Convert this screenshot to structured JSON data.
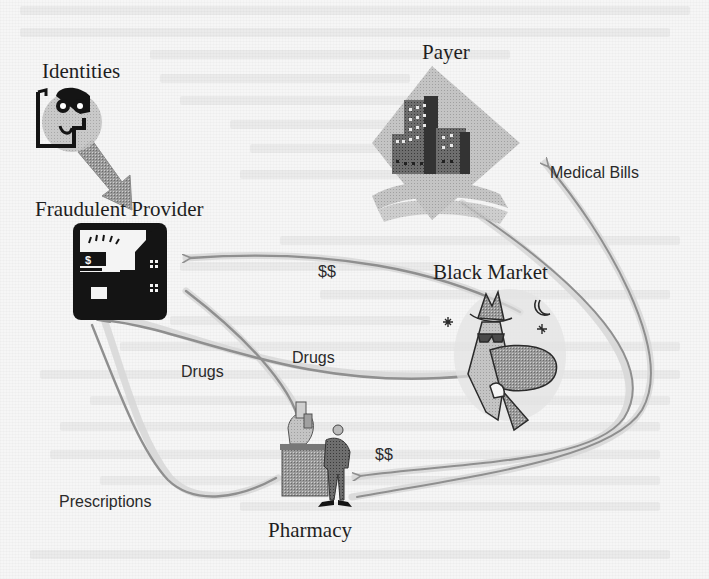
{
  "figure": {
    "nodes": [
      {
        "id": "identities",
        "label": "Identities",
        "icon": "identity-card-icon"
      },
      {
        "id": "fraudulent_provider",
        "label": "Fraudulent Provider",
        "icon": "provider-building-icon"
      },
      {
        "id": "payer",
        "label": "Payer",
        "icon": "office-buildings-icon"
      },
      {
        "id": "black_market",
        "label": "Black Market",
        "icon": "shady-dealer-icon"
      },
      {
        "id": "pharmacy",
        "label": "Pharmacy",
        "icon": "pharmacist-counter-icon"
      }
    ],
    "edges": [
      {
        "from": "identities",
        "to": "fraudulent_provider",
        "label": ""
      },
      {
        "from": "black_market",
        "to": "fraudulent_provider",
        "label": "$$"
      },
      {
        "from": "fraudulent_provider",
        "to": "black_market",
        "label": "Drugs"
      },
      {
        "from": "pharmacy",
        "to": "fraudulent_provider",
        "label": "Drugs"
      },
      {
        "from": "fraudulent_provider",
        "to": "pharmacy",
        "label": "Prescriptions"
      },
      {
        "from": "payer",
        "to": "pharmacy",
        "label": "$$"
      },
      {
        "from": "pharmacy",
        "to": "payer",
        "label": "Medical Bills"
      }
    ]
  },
  "labels": {
    "identities": "Identities",
    "fraudulent_provider": "Fraudulent Provider",
    "payer": "Payer",
    "medical_bills": "Medical Bills",
    "black_market": "Black Market",
    "money_top": "$$",
    "drugs_right": "Drugs",
    "drugs_left": "Drugs",
    "money_bottom": "$$",
    "prescriptions": "Prescriptions",
    "pharmacy": "Pharmacy"
  },
  "colors": {
    "arrow": "#8f8f8f",
    "arrow_halo": "#cfcfcf",
    "icon_dark": "#141414",
    "icon_mid": "#7a7a7a",
    "icon_light": "#b8b8b8",
    "background": "#f6f6f6"
  }
}
